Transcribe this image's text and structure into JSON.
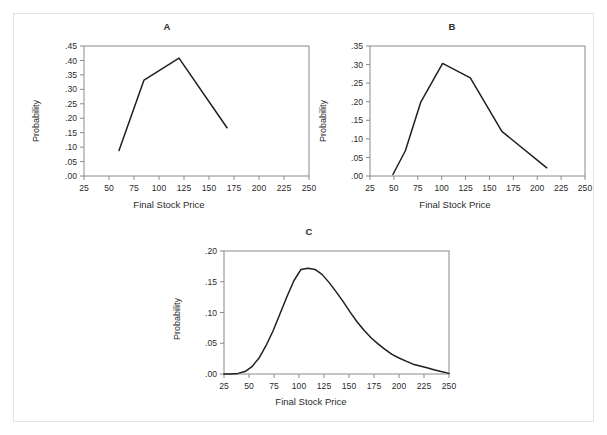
{
  "figure": {
    "background": "#ffffff",
    "border_color": "#e3e3e3",
    "axis_color": "#8a8a8a",
    "line_color": "#1f1f1f",
    "text_color": "#2b2b2b"
  },
  "panels": [
    {
      "id": "A",
      "title": "A",
      "xlabel": "Final Stock Price",
      "ylabel": "Probability"
    },
    {
      "id": "B",
      "title": "B",
      "xlabel": "Final Stock Price",
      "ylabel": "Probability"
    },
    {
      "id": "C",
      "title": "C",
      "xlabel": "Final Stock Price",
      "ylabel": "Probability"
    }
  ],
  "chart_data": [
    {
      "type": "line",
      "title": "A",
      "xlabel": "Final Stock Price",
      "ylabel": "Probability",
      "xlim": [
        25,
        250
      ],
      "ylim": [
        0.0,
        0.45
      ],
      "xticks": [
        25,
        50,
        75,
        100,
        125,
        150,
        175,
        200,
        225,
        250
      ],
      "xticklabels": [
        "25",
        "50",
        "75",
        "100",
        "125",
        "150",
        "175",
        "200",
        "225",
        "250"
      ],
      "yticks": [
        0.0,
        0.05,
        0.1,
        0.15,
        0.2,
        0.25,
        0.3,
        0.35,
        0.4,
        0.45
      ],
      "yticklabels": [
        ".00",
        ".05",
        ".10",
        ".15",
        ".20",
        ".25",
        ".30",
        ".35",
        ".40",
        ".45"
      ],
      "grid": false,
      "legend": "none",
      "series": [
        {
          "name": "Probability",
          "x": [
            60,
            85,
            120,
            168
          ],
          "y": [
            0.088,
            0.332,
            0.408,
            0.167
          ]
        }
      ]
    },
    {
      "type": "line",
      "title": "B",
      "xlabel": "Final Stock Price",
      "ylabel": "Probability",
      "xlim": [
        25,
        250
      ],
      "ylim": [
        0.0,
        0.35
      ],
      "xticks": [
        25,
        50,
        75,
        100,
        125,
        150,
        175,
        200,
        225,
        250
      ],
      "xticklabels": [
        "25",
        "50",
        "75",
        "100",
        "125",
        "150",
        "175",
        "200",
        "225",
        "250"
      ],
      "yticks": [
        0.0,
        0.05,
        0.1,
        0.15,
        0.2,
        0.25,
        0.3,
        0.35
      ],
      "yticklabels": [
        ".00",
        ".05",
        ".10",
        ".15",
        ".20",
        ".25",
        ".30",
        ".35"
      ],
      "grid": false,
      "legend": "none",
      "series": [
        {
          "name": "Probability",
          "x": [
            49,
            62,
            78,
            101,
            130,
            163,
            210
          ],
          "y": [
            0.004,
            0.068,
            0.198,
            0.303,
            0.264,
            0.12,
            0.022
          ]
        }
      ]
    },
    {
      "type": "line",
      "title": "C",
      "xlabel": "Final Stock Price",
      "ylabel": "Probability",
      "xlim": [
        25,
        250
      ],
      "ylim": [
        0.0,
        0.2
      ],
      "xticks": [
        25,
        50,
        75,
        100,
        125,
        150,
        175,
        200,
        225,
        250
      ],
      "xticklabels": [
        "25",
        "50",
        "75",
        "100",
        "125",
        "150",
        "175",
        "200",
        "225",
        "250"
      ],
      "yticks": [
        0.0,
        0.05,
        0.1,
        0.15,
        0.2
      ],
      "yticklabels": [
        ".00",
        ".05",
        ".10",
        ".15",
        ".20"
      ],
      "grid": false,
      "legend": "none",
      "series": [
        {
          "name": "Probability",
          "x": [
            25,
            32,
            39,
            46,
            53,
            60,
            67,
            74,
            81,
            88,
            95,
            102,
            109,
            116,
            123,
            130,
            137,
            144,
            151,
            158,
            165,
            172,
            179,
            186,
            193,
            200,
            207,
            214,
            221,
            228,
            235,
            242,
            250
          ],
          "y": [
            0.0,
            0.0,
            0.001,
            0.004,
            0.012,
            0.026,
            0.046,
            0.07,
            0.098,
            0.126,
            0.152,
            0.17,
            0.172,
            0.17,
            0.162,
            0.149,
            0.134,
            0.118,
            0.101,
            0.085,
            0.071,
            0.059,
            0.049,
            0.04,
            0.032,
            0.026,
            0.021,
            0.016,
            0.013,
            0.01,
            0.007,
            0.004,
            0.001
          ]
        }
      ]
    }
  ]
}
